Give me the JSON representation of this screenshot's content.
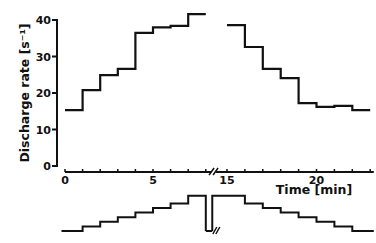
{
  "chart_data": {
    "type": "line",
    "subtype": "step",
    "title": "",
    "xlabel": "Time [min]",
    "ylabel": "Discharge rate [s⁻¹]",
    "xlim": [
      0,
      23
    ],
    "ylim": [
      0,
      40
    ],
    "axis_break": {
      "from": 8.5,
      "to": 14.5
    },
    "xticks": [
      0,
      1,
      2,
      3,
      4,
      5,
      6,
      7,
      8,
      15,
      16,
      17,
      18,
      19,
      20,
      21,
      22,
      23
    ],
    "xtick_labels": [
      {
        "value": 0,
        "label": "0"
      },
      {
        "value": 5,
        "label": "5"
      },
      {
        "value": 15,
        "label": "15"
      },
      {
        "value": 20,
        "label": "20"
      }
    ],
    "yticks": [
      {
        "value": 0,
        "label": "0"
      },
      {
        "value": 10,
        "label": "10"
      },
      {
        "value": 20,
        "label": "20"
      },
      {
        "value": 30,
        "label": "30"
      },
      {
        "value": 40,
        "label": "40"
      }
    ],
    "grid": false,
    "legend": null,
    "series": [
      {
        "name": "Discharge rate (ascending)",
        "steps": [
          {
            "x0": 0.0,
            "x1": 1.0,
            "y": 15.3
          },
          {
            "x0": 1.0,
            "x1": 2.0,
            "y": 20.8
          },
          {
            "x0": 2.0,
            "x1": 3.0,
            "y": 24.9
          },
          {
            "x0": 3.0,
            "x1": 4.0,
            "y": 26.6
          },
          {
            "x0": 4.0,
            "x1": 5.0,
            "y": 36.5
          },
          {
            "x0": 5.0,
            "x1": 6.0,
            "y": 38.0
          },
          {
            "x0": 6.0,
            "x1": 7.0,
            "y": 38.4
          },
          {
            "x0": 7.0,
            "x1": 8.0,
            "y": 41.6
          }
        ]
      },
      {
        "name": "Discharge rate (descending)",
        "steps": [
          {
            "x0": 15.0,
            "x1": 16.0,
            "y": 38.6
          },
          {
            "x0": 16.0,
            "x1": 17.0,
            "y": 32.6
          },
          {
            "x0": 17.0,
            "x1": 18.0,
            "y": 26.6
          },
          {
            "x0": 18.0,
            "x1": 19.0,
            "y": 24.1
          },
          {
            "x0": 19.0,
            "x1": 20.0,
            "y": 17.2
          },
          {
            "x0": 20.0,
            "x1": 21.0,
            "y": 16.2
          },
          {
            "x0": 21.0,
            "x1": 22.0,
            "y": 16.5
          },
          {
            "x0": 22.0,
            "x1": 23.0,
            "y": 15.3
          }
        ]
      }
    ],
    "stimulus_trace": {
      "description": "Staircase stimulus protocol below time axis: 8 ascending steps, interruption (drop with break mark), then 8 descending steps",
      "levels_ascending": [
        0,
        1,
        2,
        3,
        4,
        5,
        6,
        7
      ],
      "levels_descending": [
        7,
        6,
        5,
        4,
        3,
        2,
        1,
        0
      ]
    }
  }
}
